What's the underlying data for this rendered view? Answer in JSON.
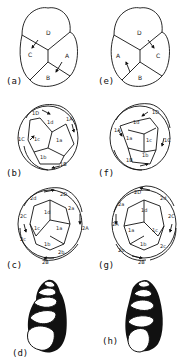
{
  "figure": {
    "panels": [
      {
        "id": "a",
        "label": "(a)",
        "stage": "4-cell",
        "cells": [
          "D",
          "C",
          "A",
          "B"
        ]
      },
      {
        "id": "b",
        "label": "(b)",
        "stage": "8-cell",
        "cells": [
          "1D",
          "1d",
          "1A",
          "1a",
          "1C",
          "1c",
          "1b",
          "1B"
        ]
      },
      {
        "id": "c",
        "label": "(c)",
        "stage": "16-cell",
        "cells": [
          "2d",
          "2D",
          "1d",
          "2a",
          "2C",
          "1c",
          "1a",
          "2A",
          "2c",
          "1b",
          "2b",
          "2B"
        ]
      },
      {
        "id": "d",
        "label": "(d)",
        "stage": "adult shell",
        "coiling": "dextral"
      },
      {
        "id": "e",
        "label": "(e)",
        "stage": "4-cell",
        "cells": [
          "D",
          "A",
          "C",
          "B"
        ]
      },
      {
        "id": "f",
        "label": "(f)",
        "stage": "8-cell",
        "cells": [
          "1D",
          "1d",
          "1A",
          "1a",
          "1c",
          "1C",
          "1B",
          "1b"
        ]
      },
      {
        "id": "g",
        "label": "(g)",
        "stage": "16-cell",
        "cells": [
          "2D",
          "1d",
          "2d",
          "2a",
          "2C",
          "2A",
          "1a",
          "1c",
          "1b",
          "2c",
          "2b",
          "2B"
        ]
      },
      {
        "id": "h",
        "label": "(h)",
        "stage": "adult shell",
        "coiling": "sinistral"
      }
    ]
  }
}
